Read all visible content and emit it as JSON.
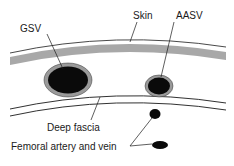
{
  "diagram": {
    "labels": {
      "gsv": "GSV",
      "skin": "Skin",
      "aasv": "AASV",
      "deep_fascia": "Deep fascia",
      "femoral": "Femoral artery and vein"
    },
    "colors": {
      "line": "#1a1a1a",
      "skin_band": "#a8a8a8",
      "vessel_wall": "#9a9a9a",
      "vessel_lumen": "#0a0a0a",
      "background": "#ffffff"
    }
  }
}
